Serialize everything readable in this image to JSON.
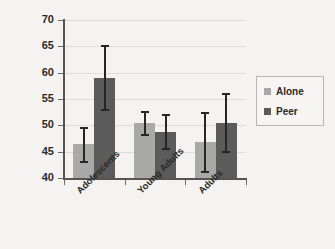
{
  "chart_data": {
    "type": "bar",
    "title": "",
    "xlabel": "",
    "ylabel": "% Risky Decisions",
    "ylim": [
      40,
      70
    ],
    "yticks": [
      40,
      45,
      50,
      55,
      60,
      65,
      70
    ],
    "ytick_labels": [
      "40",
      "45",
      "50",
      "55",
      "60",
      "65",
      "70"
    ],
    "grid": true,
    "legend_position": "right",
    "categories": [
      "Adolescents",
      "Young Adults",
      "Adults"
    ],
    "series": [
      {
        "name": "Alone",
        "color": "#a9a9a7",
        "values": [
          46.4,
          50.4,
          46.8
        ],
        "error_low": [
          43.1,
          48.2,
          41.2
        ],
        "error_high": [
          49.5,
          52.5,
          52.3
        ]
      },
      {
        "name": "Peer",
        "color": "#5b5b5b",
        "values": [
          59.0,
          48.8,
          50.4
        ],
        "error_low": [
          52.9,
          45.5,
          44.9
        ],
        "error_high": [
          65.0,
          52.0,
          55.9
        ]
      }
    ]
  },
  "legend": {
    "items": [
      {
        "label": "Alone",
        "swatch": "legend-swatch-alone"
      },
      {
        "label": "Peer",
        "swatch": "legend-swatch-peer"
      }
    ]
  }
}
